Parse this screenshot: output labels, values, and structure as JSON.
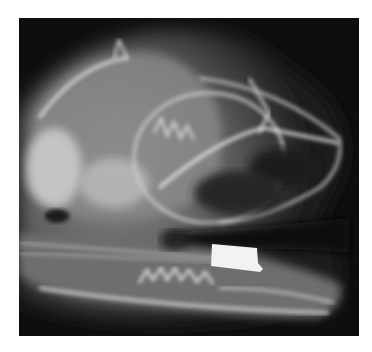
{
  "image": {
    "subject": "Lateral radiograph (X-ray) of an animal skull with jaw open",
    "description": "Grayscale X-ray showing a skull in side view; upper jaw with teeth, lower jaw (mandible) with serrated teeth, orbit, and a bright rectangular radiopaque metal object near the lower jaw",
    "colors": {
      "background": "#ffffff",
      "film": "#0e0e0e",
      "bone": "#d8d8d8",
      "soft_tissue": "#555555",
      "metal_object": "#f2f2f2"
    },
    "features": [
      "cranium",
      "orbit",
      "upper-jaw-teeth",
      "mandible",
      "lower-jaw-teeth",
      "radiopaque-metal-object"
    ]
  }
}
